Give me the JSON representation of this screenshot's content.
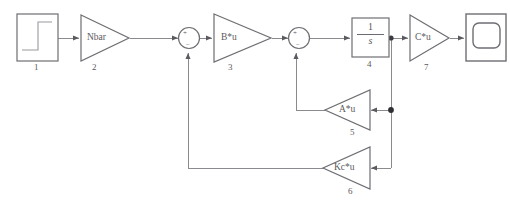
{
  "diagram": {
    "title_partial": "",
    "type": "state-space feedback control block diagram",
    "line_color": "#8a8a8f",
    "block_stroke": "#6e6e74",
    "block_fill": "#ffffff",
    "label_color": "#55555a",
    "blocks": [
      {
        "num": "1",
        "name": "",
        "kind": "step-source",
        "shape": "square"
      },
      {
        "num": "2",
        "name": "Nbar",
        "kind": "gain",
        "shape": "triangle-right"
      },
      {
        "num": "3",
        "name": "B*u",
        "kind": "gain",
        "shape": "triangle-right"
      },
      {
        "num": "4",
        "name": "",
        "kind": "integrator",
        "shape": "square",
        "numerator": "1",
        "denominator": "s"
      },
      {
        "num": "5",
        "name": "A*u",
        "kind": "feedback-gain",
        "shape": "triangle-left"
      },
      {
        "num": "6",
        "name": "Kc*u",
        "kind": "feedback-gain",
        "shape": "triangle-left"
      },
      {
        "num": "7",
        "name": "C*u",
        "kind": "gain",
        "shape": "triangle-right"
      }
    ],
    "sum_junctions": [
      {
        "id": "sum-1",
        "plus": "+",
        "minus": "−"
      },
      {
        "id": "sum-2",
        "plus": "+",
        "minus": "−"
      }
    ],
    "scope": {
      "kind": "scope-display",
      "name": ""
    }
  }
}
